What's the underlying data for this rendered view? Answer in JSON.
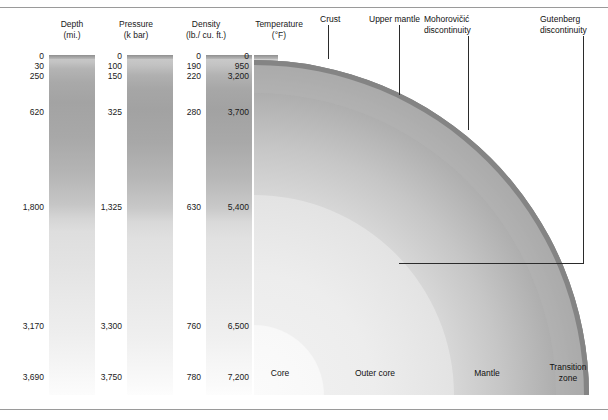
{
  "figure": {
    "title_hidden": "",
    "columns": [
      {
        "id": "depth",
        "header_line1": "Depth",
        "header_line2": "(mi.)",
        "ticks": [
          {
            "label": "0",
            "pos": 0.0
          },
          {
            "label": "30",
            "pos": 0.028
          },
          {
            "label": "250",
            "pos": 0.059
          },
          {
            "label": "620",
            "pos": 0.165
          },
          {
            "label": "1,800",
            "pos": 0.445
          },
          {
            "label": "3,170",
            "pos": 0.795
          },
          {
            "label": "3,690",
            "pos": 0.943
          }
        ]
      },
      {
        "id": "pressure",
        "header_line1": "Pressure",
        "header_line2": "(k bar)",
        "ticks": [
          {
            "label": "0",
            "pos": 0.0
          },
          {
            "label": "100",
            "pos": 0.028
          },
          {
            "label": "150",
            "pos": 0.059
          },
          {
            "label": "325",
            "pos": 0.165
          },
          {
            "label": "1,325",
            "pos": 0.445
          },
          {
            "label": "3,300",
            "pos": 0.795
          },
          {
            "label": "3,750",
            "pos": 0.943
          }
        ]
      },
      {
        "id": "density",
        "header_line1": "Density",
        "header_line2": "(lb./ cu. ft.)",
        "ticks": [
          {
            "label": "0",
            "pos": 0.0
          },
          {
            "label": "190",
            "pos": 0.028
          },
          {
            "label": "220",
            "pos": 0.059
          },
          {
            "label": "280",
            "pos": 0.165
          },
          {
            "label": "630",
            "pos": 0.445
          },
          {
            "label": "760",
            "pos": 0.795
          },
          {
            "label": "780",
            "pos": 0.943
          }
        ]
      },
      {
        "id": "temperature",
        "header_line1": "Temperature",
        "header_line2": "(°F)",
        "ticks": [
          {
            "label": "0",
            "pos": 0.0
          },
          {
            "label": "950",
            "pos": 0.028
          },
          {
            "label": "3,200",
            "pos": 0.059
          },
          {
            "label": "3,700",
            "pos": 0.165
          },
          {
            "label": "5,400",
            "pos": 0.445
          },
          {
            "label": "6,500",
            "pos": 0.795
          },
          {
            "label": "7,200",
            "pos": 0.943
          }
        ]
      }
    ],
    "callouts": [
      {
        "id": "crust",
        "text": "Crust"
      },
      {
        "id": "upper-mantle",
        "text": "Upper mantle"
      },
      {
        "id": "moho",
        "line1": "Mohorovičić",
        "line2": "discontinuity"
      },
      {
        "id": "gutenberg",
        "line1": "Gutenberg",
        "line2": "discontinuity"
      }
    ],
    "zone_labels": [
      {
        "id": "core",
        "text": "Core"
      },
      {
        "id": "outer-core",
        "text": "Outer core"
      },
      {
        "id": "mantle",
        "text": "Mantle"
      },
      {
        "id": "transition-zone",
        "line1": "Transition",
        "line2": "zone"
      }
    ],
    "colors": {
      "crust_line": "#5c5c5c",
      "leader_line": "#2b2b2b",
      "frame_line": "#9a9a9a",
      "text": "#111111"
    }
  }
}
